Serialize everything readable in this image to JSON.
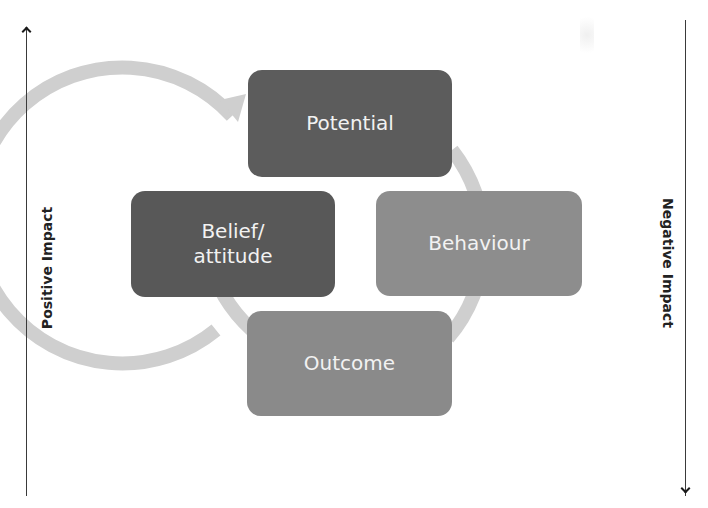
{
  "diagram": {
    "type": "cycle",
    "nodes": [
      {
        "id": "potential",
        "label": "Potential",
        "color": "#5c5c5c"
      },
      {
        "id": "behaviour",
        "label": "Behaviour",
        "color": "#8d8d8d"
      },
      {
        "id": "outcome",
        "label": "Outcome",
        "color": "#8a8a8a"
      },
      {
        "id": "belief",
        "label": "Belief/\nattitude",
        "label_line1": "Belief/",
        "label_line2": "attitude",
        "color": "#585858"
      }
    ],
    "cycle_direction": "clockwise",
    "ring_color": "#cfcfcf"
  },
  "axes": {
    "left": {
      "label": "Positive Impact",
      "direction": "up"
    },
    "right": {
      "label": "Negative Impact",
      "direction": "down"
    }
  },
  "colors": {
    "background": "#ffffff",
    "axis_line": "#3a3a3a",
    "box_text": "#f2f2f2"
  }
}
